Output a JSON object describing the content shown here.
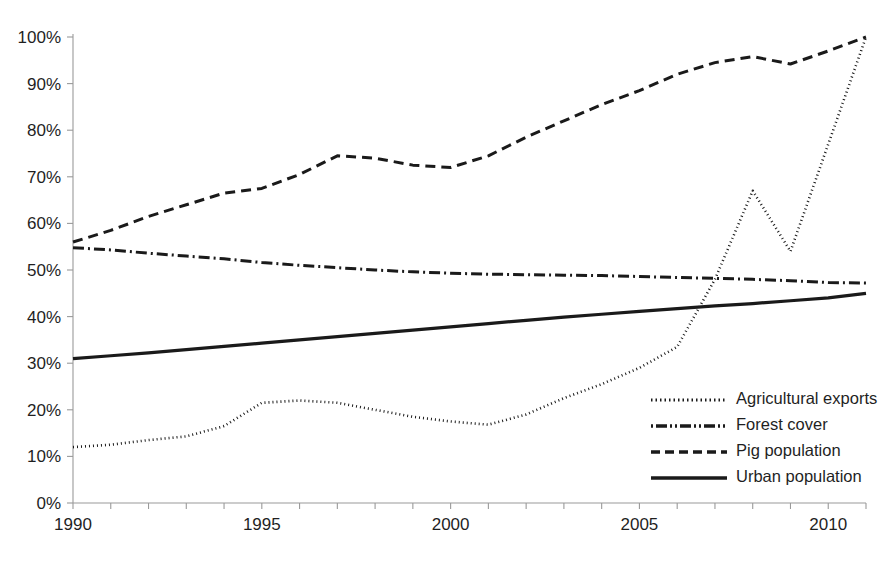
{
  "chart_data": {
    "type": "line",
    "title": "",
    "subtitle": "",
    "xlabel": "",
    "ylabel": "",
    "xlim": [
      1990,
      2011
    ],
    "ylim": [
      0,
      100
    ],
    "grid": false,
    "legend_position": "inside-bottom-right",
    "y_tick_labels": [
      "0%",
      "10%",
      "20%",
      "30%",
      "40%",
      "50%",
      "60%",
      "70%",
      "80%",
      "90%",
      "100%"
    ],
    "y_tick_values": [
      0,
      10,
      20,
      30,
      40,
      50,
      60,
      70,
      80,
      90,
      100
    ],
    "x_tick_labels": [
      "1990",
      "1995",
      "2000",
      "2005",
      "2010"
    ],
    "x_tick_values": [
      1990,
      1995,
      2000,
      2005,
      2010
    ],
    "x_minor_ticks": [
      1990,
      1991,
      1992,
      1993,
      1994,
      1995,
      1996,
      1997,
      1998,
      1999,
      2000,
      2001,
      2002,
      2003,
      2004,
      2005,
      2006,
      2007,
      2008,
      2009,
      2010,
      2011
    ],
    "x": [
      1990,
      1991,
      1992,
      1993,
      1994,
      1995,
      1996,
      1997,
      1998,
      1999,
      2000,
      2001,
      2002,
      2003,
      2004,
      2005,
      2006,
      2007,
      2008,
      2009,
      2010,
      2011
    ],
    "series": [
      {
        "name": "Agricultural exports",
        "style": "dotted",
        "color": "#1a1a1a",
        "width": 2.6,
        "dash": "1,3",
        "values": [
          12,
          12.5,
          13.5,
          14.3,
          16.5,
          21.5,
          22,
          21.5,
          20,
          18.5,
          17.5,
          16.8,
          19,
          22.5,
          25.5,
          29,
          33.5,
          48,
          67,
          54,
          77,
          100
        ]
      },
      {
        "name": "Forest cover",
        "style": "dash-dot",
        "color": "#1a1a1a",
        "width": 3.0,
        "dash": "11,4,2,4",
        "values": [
          54.8,
          54.3,
          53.6,
          53.0,
          52.4,
          51.6,
          51.0,
          50.5,
          50.0,
          49.6,
          49.3,
          49.1,
          49.0,
          48.9,
          48.8,
          48.6,
          48.4,
          48.2,
          48.0,
          47.7,
          47.3,
          47.2
        ]
      },
      {
        "name": "Pig population",
        "style": "dashed",
        "color": "#1a1a1a",
        "width": 3.0,
        "dash": "10,6",
        "values": [
          56,
          58.5,
          61.5,
          64,
          66.5,
          67.5,
          70.5,
          74.5,
          74,
          72.5,
          72,
          74.5,
          78.5,
          82,
          85.5,
          88.5,
          92,
          94.5,
          95.8,
          94.2,
          97,
          100
        ]
      },
      {
        "name": "Urban population",
        "style": "solid",
        "color": "#1a1a1a",
        "width": 3.2,
        "dash": "",
        "values": [
          31,
          31.6,
          32.2,
          32.9,
          33.6,
          34.3,
          35.0,
          35.7,
          36.4,
          37.1,
          37.8,
          38.5,
          39.2,
          39.9,
          40.5,
          41.1,
          41.7,
          42.3,
          42.8,
          43.4,
          44.0,
          45.0
        ]
      }
    ],
    "legend_entries": [
      {
        "label": "Agricultural exports",
        "style": "dotted",
        "dash": "1.5,3",
        "width": 3.0
      },
      {
        "label": "Forest cover",
        "style": "dash-dot",
        "dash": "2,3,11,3,2,3",
        "width": 3.4
      },
      {
        "label": "Pig population",
        "style": "dashed",
        "dash": "9,5",
        "width": 3.4
      },
      {
        "label": "Urban population",
        "style": "solid",
        "dash": "",
        "width": 3.6
      }
    ]
  }
}
